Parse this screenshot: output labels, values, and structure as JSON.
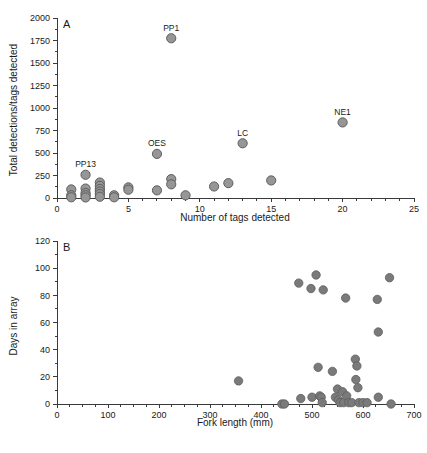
{
  "figure": {
    "title": "",
    "background": "#ffffff",
    "marker_color": "#969696",
    "marker_edge_color": "#5e5e5e",
    "axis_color": "#3a3a3a"
  },
  "panel_a": {
    "letter": "A",
    "xlabel": "Number of tags detected",
    "ylabel": "Total detections/tags detected",
    "x_ticks": [
      "0",
      "5",
      "10",
      "15",
      "20",
      "25"
    ],
    "y_ticks": [
      "0",
      "250",
      "500",
      "750",
      "1000",
      "1250",
      "1500",
      "1750",
      "2000"
    ]
  },
  "panel_b": {
    "letter": "B",
    "xlabel": "Fork length (mm)",
    "ylabel": "Days in array",
    "x_ticks": [
      "0",
      "100",
      "200",
      "300",
      "400",
      "500",
      "600",
      "700"
    ],
    "y_ticks": [
      "0",
      "20",
      "40",
      "60",
      "80",
      "100",
      "120"
    ]
  },
  "chart_data": [
    {
      "type": "scatter",
      "panel": "A",
      "title": "",
      "xlabel": "Number of tags detected",
      "ylabel": "Total detections/tags detected",
      "xlim": [
        0,
        25
      ],
      "ylim": [
        0,
        2000
      ],
      "xticks": [
        0,
        5,
        10,
        15,
        20,
        25
      ],
      "yticks": [
        0,
        250,
        500,
        750,
        1000,
        1250,
        1500,
        1750,
        2000
      ],
      "x_minor_tick_step": 1,
      "y_minor_tick_step": 125,
      "grid": false,
      "legend": null,
      "points": [
        {
          "x": 1,
          "y": 95
        },
        {
          "x": 1,
          "y": 30
        },
        {
          "x": 1,
          "y": 8
        },
        {
          "x": 2,
          "y": 258,
          "label": "PP13"
        },
        {
          "x": 2,
          "y": 105
        },
        {
          "x": 2,
          "y": 55
        },
        {
          "x": 2,
          "y": 30
        },
        {
          "x": 2,
          "y": 6
        },
        {
          "x": 3,
          "y": 172
        },
        {
          "x": 3,
          "y": 135
        },
        {
          "x": 3,
          "y": 100
        },
        {
          "x": 3,
          "y": 72
        },
        {
          "x": 3,
          "y": 45
        },
        {
          "x": 3,
          "y": 14
        },
        {
          "x": 4,
          "y": 30
        },
        {
          "x": 4,
          "y": 8
        },
        {
          "x": 5,
          "y": 118
        },
        {
          "x": 5,
          "y": 92
        },
        {
          "x": 7,
          "y": 490,
          "label": "OES"
        },
        {
          "x": 7,
          "y": 85
        },
        {
          "x": 8,
          "y": 1775,
          "label": "PP1"
        },
        {
          "x": 8,
          "y": 210
        },
        {
          "x": 8,
          "y": 152
        },
        {
          "x": 9,
          "y": 30
        },
        {
          "x": 11,
          "y": 128
        },
        {
          "x": 12,
          "y": 165
        },
        {
          "x": 13,
          "y": 608,
          "label": "LC"
        },
        {
          "x": 15,
          "y": 195
        },
        {
          "x": 20,
          "y": 840,
          "label": "NE1"
        }
      ],
      "annotations": [
        {
          "text": "PP1",
          "x": 8,
          "y": 1775
        },
        {
          "text": "PP13",
          "x": 2,
          "y": 258
        },
        {
          "text": "OES",
          "x": 7,
          "y": 490
        },
        {
          "text": "LC",
          "x": 13,
          "y": 608
        },
        {
          "text": "NE1",
          "x": 20,
          "y": 840
        }
      ]
    },
    {
      "type": "scatter",
      "panel": "B",
      "title": "",
      "xlabel": "Fork length (mm)",
      "ylabel": "Days in array",
      "xlim": [
        0,
        700
      ],
      "ylim": [
        0,
        120
      ],
      "xticks": [
        0,
        100,
        200,
        300,
        400,
        500,
        600,
        700
      ],
      "yticks": [
        0,
        20,
        40,
        60,
        80,
        100,
        120
      ],
      "x_minor_tick_step": 25,
      "y_minor_tick_step": 10,
      "grid": false,
      "legend": null,
      "points": [
        {
          "x": 356,
          "y": 17
        },
        {
          "x": 441,
          "y": 0
        },
        {
          "x": 446,
          "y": 0
        },
        {
          "x": 474,
          "y": 89
        },
        {
          "x": 478,
          "y": 4
        },
        {
          "x": 498,
          "y": 85
        },
        {
          "x": 500,
          "y": 5
        },
        {
          "x": 508,
          "y": 95
        },
        {
          "x": 512,
          "y": 27
        },
        {
          "x": 515,
          "y": 6
        },
        {
          "x": 518,
          "y": 5
        },
        {
          "x": 520,
          "y": 1
        },
        {
          "x": 522,
          "y": 84
        },
        {
          "x": 540,
          "y": 24
        },
        {
          "x": 546,
          "y": 5
        },
        {
          "x": 550,
          "y": 11
        },
        {
          "x": 552,
          "y": 3
        },
        {
          "x": 555,
          "y": 1
        },
        {
          "x": 560,
          "y": 9
        },
        {
          "x": 562,
          "y": 1
        },
        {
          "x": 566,
          "y": 78
        },
        {
          "x": 568,
          "y": 6
        },
        {
          "x": 572,
          "y": 1
        },
        {
          "x": 578,
          "y": 1
        },
        {
          "x": 585,
          "y": 33
        },
        {
          "x": 586,
          "y": 18
        },
        {
          "x": 588,
          "y": 28
        },
        {
          "x": 590,
          "y": 12
        },
        {
          "x": 592,
          "y": 1
        },
        {
          "x": 600,
          "y": 1
        },
        {
          "x": 608,
          "y": 1
        },
        {
          "x": 628,
          "y": 77
        },
        {
          "x": 630,
          "y": 53
        },
        {
          "x": 630,
          "y": 5
        },
        {
          "x": 652,
          "y": 93
        },
        {
          "x": 655,
          "y": 0
        }
      ],
      "annotations": []
    }
  ]
}
